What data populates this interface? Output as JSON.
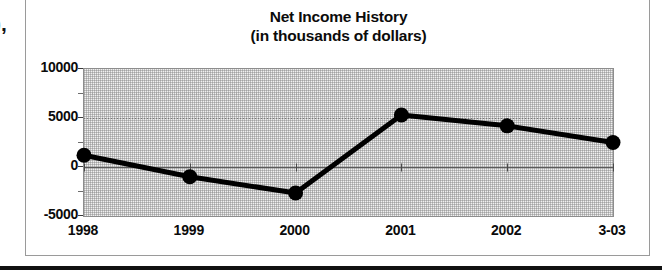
{
  "scan_artifact": {
    "clipped_text": "),"
  },
  "chart_data": {
    "type": "line",
    "title": "Net Income History",
    "subtitle": "(in thousands of dollars)",
    "title_lines": [
      "Net Income History",
      "(in thousands of dollars)"
    ],
    "xlabel": "",
    "ylabel": "",
    "categories": [
      "1998",
      "1999",
      "2000",
      "2001",
      "2002",
      "3-03"
    ],
    "values": [
      1200,
      -1000,
      -2650,
      5300,
      4200,
      2500
    ],
    "series": [
      {
        "name": "Net Income",
        "values": [
          1200,
          -1000,
          -2650,
          5300,
          4200,
          2500
        ]
      }
    ],
    "ylim": [
      -5000,
      10000
    ],
    "ytick_labels": [
      "10000",
      "5000",
      "0",
      "-5000"
    ],
    "ytick_values": [
      10000,
      5000,
      0,
      -5000
    ],
    "yminor_step": 2500,
    "grid": true,
    "grid_style": "dotted-horizontal-at-major-ticks",
    "legend": null,
    "legend_position": "none",
    "marker": "filled-circle",
    "line_color": "#000000",
    "marker_color": "#000000",
    "plot_background": "#f0f0f0",
    "annotations": []
  },
  "axis": {
    "y_labels": [
      {
        "text": "10000",
        "value": 10000
      },
      {
        "text": "5000",
        "value": 5000
      },
      {
        "text": "0",
        "value": 0
      },
      {
        "text": "-5000",
        "value": -5000
      }
    ],
    "x_labels": [
      {
        "text": "1998"
      },
      {
        "text": "1999"
      },
      {
        "text": "2000"
      },
      {
        "text": "2001"
      },
      {
        "text": "2002"
      },
      {
        "text": "3-03"
      }
    ]
  },
  "colors": {
    "ink": "#0b0b0b",
    "frame": "#9a9a9a",
    "plot_border": "#8d8d8d",
    "plot_fill": "#f0f0f0",
    "series_line": "#000000",
    "rule": "#111111"
  }
}
